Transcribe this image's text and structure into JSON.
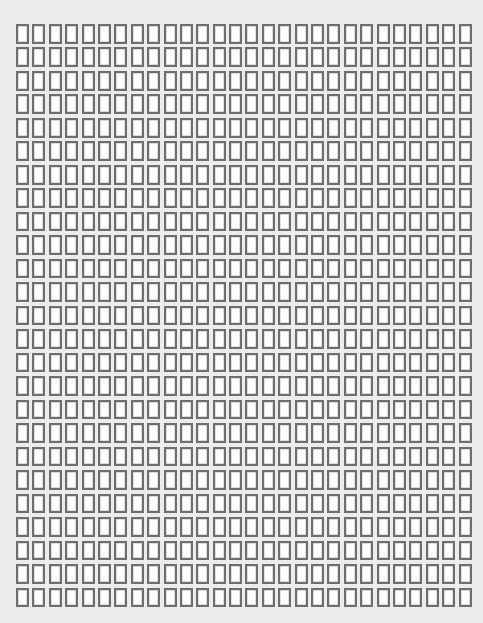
{
  "page": {
    "background_color": "#ececec"
  },
  "grid": {
    "rows": 25,
    "columns": 28,
    "cell_border_color": "#6e6e6e",
    "cell_fill_color": "#ffffff"
  }
}
